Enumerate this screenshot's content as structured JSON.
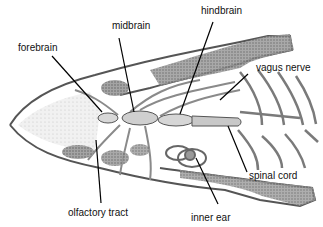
{
  "figure": {
    "labels": [
      {
        "id": "forebrain",
        "text": "forebrain",
        "x": 18,
        "y": 42
      },
      {
        "id": "midbrain",
        "text": "midbrain",
        "x": 112,
        "y": 20
      },
      {
        "id": "hindbrain",
        "text": "hindbrain",
        "x": 201,
        "y": 5
      },
      {
        "id": "vagus-nerve",
        "text": "vagus nerve",
        "x": 256,
        "y": 62
      },
      {
        "id": "spinal-cord",
        "text": "spinal cord",
        "x": 249,
        "y": 170
      },
      {
        "id": "olfactory-tract",
        "text": "olfactory tract",
        "x": 68,
        "y": 207
      },
      {
        "id": "inner-ear",
        "text": "inner ear",
        "x": 191,
        "y": 212
      }
    ],
    "colors": {
      "background": "#ffffff",
      "ink": "#111111",
      "stipple_dark": "#6e6e6e",
      "stipple_light": "#bdbdbd"
    }
  }
}
